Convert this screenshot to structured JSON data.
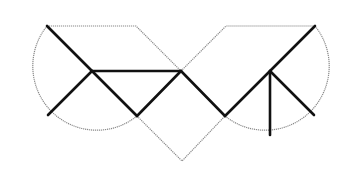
{
  "diagram": {
    "colors": {
      "outline": "#8a8a8a",
      "dissection": "#111111",
      "background": "#ffffff"
    },
    "left_circle": {
      "center": [
        92,
        71
      ],
      "radius": 64
    },
    "right_circle": {
      "center": [
        270,
        71
      ],
      "radius": 64
    },
    "junction_point": [
      181,
      71
    ],
    "diamond_bottom": [
      182,
      161
    ]
  }
}
